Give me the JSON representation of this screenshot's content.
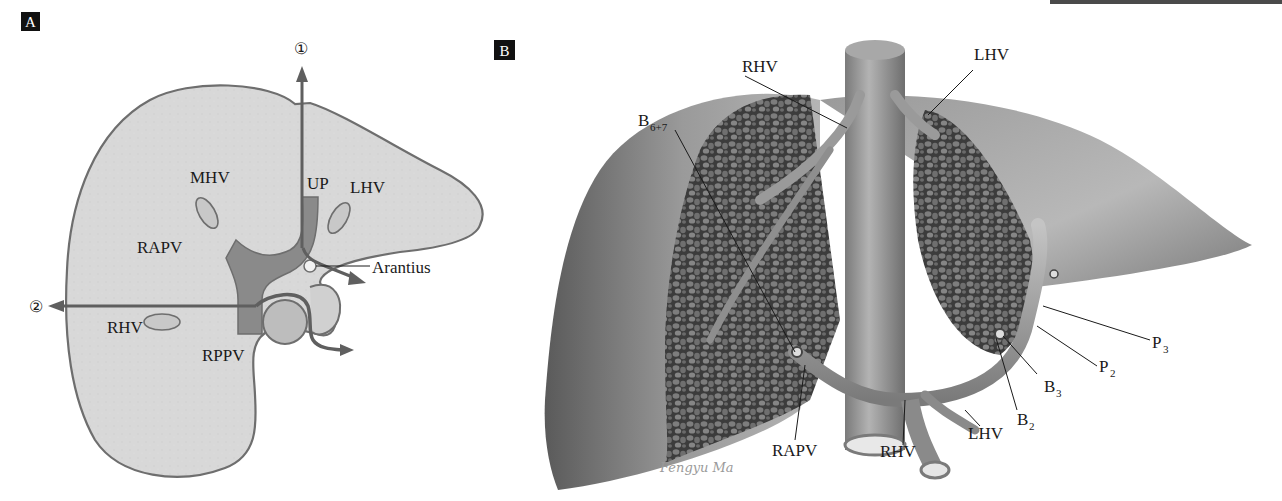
{
  "figure": {
    "panels": [
      {
        "tag": "A",
        "labels": {
          "arrow1": "①",
          "arrow2": "②",
          "mhv": "MHV",
          "up": "UP",
          "lhv": "LHV",
          "rapv": "RAPV",
          "arantius": "Arantius",
          "rhv": "RHV",
          "rppv": "RPPV"
        }
      },
      {
        "tag": "B",
        "labels": {
          "rhv_top": "RHV",
          "lhv_top": "LHV",
          "b67_base": "B",
          "b67_sub": "6+7",
          "p3_base": "P",
          "p3_sub": "3",
          "p2_base": "P",
          "p2_sub": "2",
          "b3_base": "B",
          "b3_sub": "3",
          "b2_base": "B",
          "b2_sub": "2",
          "rapv": "RAPV",
          "rhv_bottom": "RHV",
          "lhv_bottom": "LHV",
          "signature": "Fengyu Ma"
        }
      }
    ],
    "colors": {
      "liver_fill_a": "#d9d9d9",
      "outline_a": "#6e6e6e",
      "portal_vein_a": "#8a8a8a",
      "arrow_a": "#5f5f5f",
      "parenchyma_b": "#4a4a4a",
      "surface_b": "#8c8c8c"
    }
  }
}
